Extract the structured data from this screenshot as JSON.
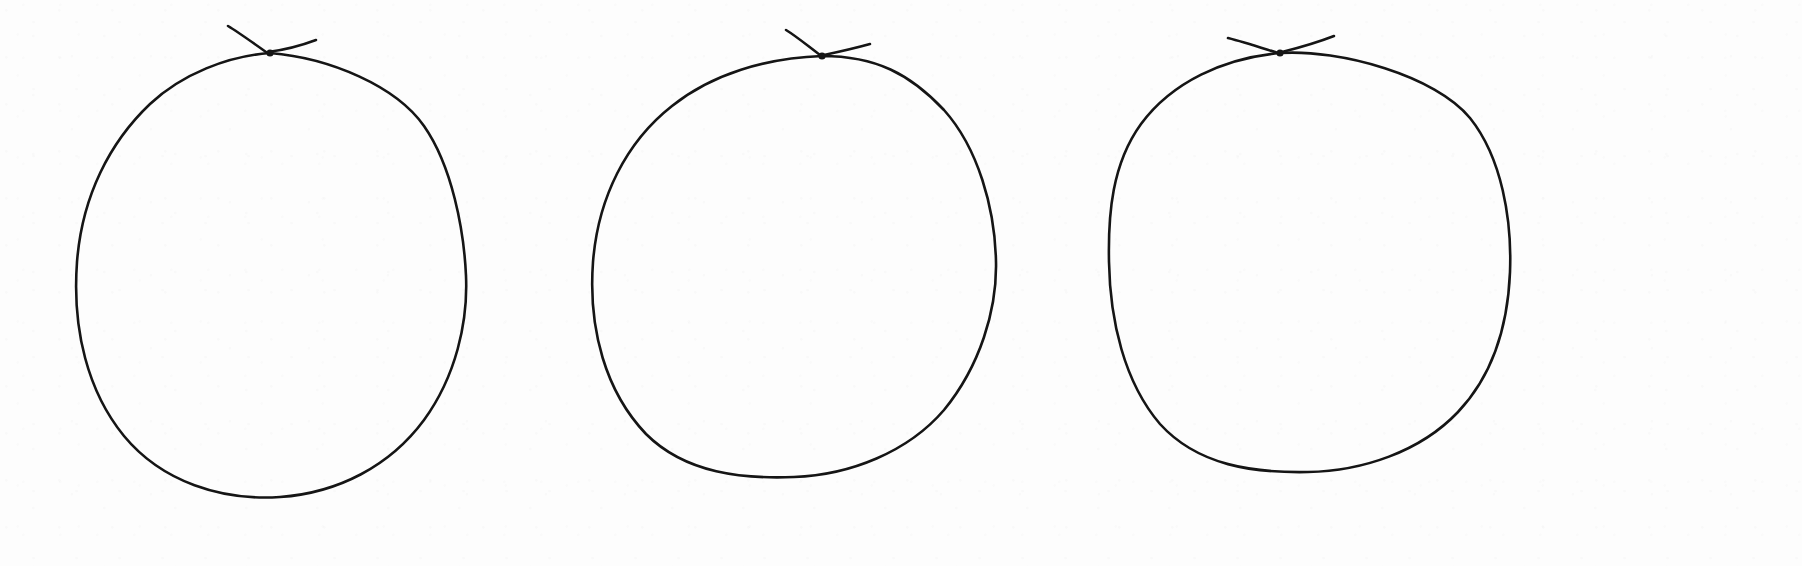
{
  "canvas": {
    "width": 1802,
    "height": 566,
    "background_color": "#fdfdfd",
    "ink_color": "#151515",
    "medium": "pen-on-paper",
    "description": "Three hand-drawn circles in black ink on plain white paper, arranged left to right. Each circle is closed at the top with a small self-crossing knot where the start and end of the stroke overshoot past one another, leaving two short tails angling up-left and up-right."
  },
  "figure": {
    "type": "hand-drawn-sketch",
    "shape_count": 3,
    "shape_label": "circle"
  },
  "shapes": [
    {
      "id": "circle-1",
      "index": 1,
      "label": "left circle",
      "center_x": 272,
      "center_y": 275,
      "radius_x": 196,
      "radius_y": 223,
      "bbox": {
        "left": 76,
        "top": 52,
        "right": 468,
        "bottom": 498
      },
      "stroke_width": 2.6,
      "crossing_point": {
        "x": 270,
        "y": 53
      },
      "tail_left_end": {
        "x": 228,
        "y": 26
      },
      "tail_right_end": {
        "x": 314,
        "y": 41
      },
      "outline_path": "M 270 53 C 228 56 182 74 150 104 C 110 142 82 196 77 262 C 72 330 88 392 124 436 C 162 482 222 501 280 497 C 338 493 390 466 424 420 C 456 376 468 322 466 276 C 464 230 452 166 424 126 C 396 86 330 58 270 53 Z",
      "tail_left_path": "M 228 26 C 238 32 252 42 266 52",
      "tail_right_path": "M 268 52 C 284 50 300 46 316 40"
    },
    {
      "id": "circle-2",
      "index": 2,
      "label": "middle circle",
      "center_x": 795,
      "center_y": 266,
      "radius_x": 203,
      "radius_y": 211,
      "bbox": {
        "left": 592,
        "top": 55,
        "right": 998,
        "bottom": 477
      },
      "stroke_width": 2.6,
      "crossing_point": {
        "x": 822,
        "y": 56
      },
      "tail_left_end": {
        "x": 786,
        "y": 30
      },
      "tail_right_end": {
        "x": 868,
        "y": 45
      },
      "outline_path": "M 822 56 C 766 58 712 74 672 106 C 626 142 598 198 593 262 C 588 330 606 392 646 434 C 686 474 744 479 794 477 C 850 475 908 452 944 410 C 980 366 997 310 996 262 C 995 208 978 148 944 110 C 910 74 876 56 822 56 Z",
      "tail_left_path": "M 786 30 C 796 36 808 46 820 55",
      "tail_right_path": "M 824 55 C 838 52 852 49 870 44"
    },
    {
      "id": "circle-3",
      "index": 3,
      "label": "right circle",
      "center_x": 1310,
      "center_y": 262,
      "radius_x": 202,
      "radius_y": 210,
      "bbox": {
        "left": 1108,
        "top": 52,
        "right": 1512,
        "bottom": 472
      },
      "stroke_width": 2.6,
      "crossing_point": {
        "x": 1280,
        "y": 53
      },
      "tail_left_end": {
        "x": 1228,
        "y": 38
      },
      "tail_right_end": {
        "x": 1332,
        "y": 36
      },
      "outline_path": "M 1280 53 C 1224 58 1172 82 1141 124 C 1112 164 1108 214 1109 262 C 1110 320 1124 382 1160 424 C 1198 466 1254 473 1308 472 C 1362 471 1420 452 1458 412 C 1494 374 1508 322 1510 272 C 1512 220 1502 158 1470 118 C 1436 76 1340 49 1280 53 Z",
      "tail_left_path": "M 1228 38 C 1244 42 1262 48 1278 53",
      "tail_right_path": "M 1282 52 C 1298 48 1316 43 1334 36"
    }
  ]
}
